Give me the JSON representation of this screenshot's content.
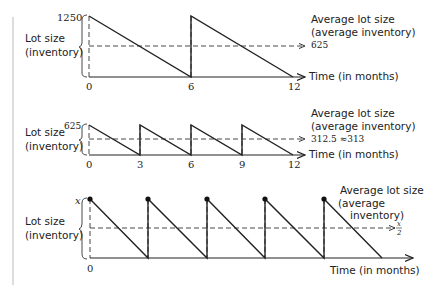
{
  "figure": {
    "margin_line_color": "#bbbbbb",
    "panels": [
      {
        "id": "annual-single-order",
        "y_label_line1": "Lot size",
        "y_label_line2": "(inventory)",
        "y_max_label": "1250",
        "x_ticks": [
          "0",
          "6",
          "12"
        ],
        "avg_label_line1": "Average lot size",
        "avg_label_line2": "(average inventory)",
        "avg_value": "625",
        "x_axis_label": "Time (in months)"
      },
      {
        "id": "quarterly-orders",
        "y_label_line1": "Lot size",
        "y_label_line2": "(inventory)",
        "y_max_label": "625",
        "x_ticks": [
          "0",
          "3",
          "6",
          "9",
          "12"
        ],
        "avg_label_line1": "Average lot size",
        "avg_label_line2": "(average inventory)",
        "avg_value": "312.5 ≈313",
        "x_axis_label": "Time (in months)"
      },
      {
        "id": "general-x-orders",
        "y_label_line1": "Lot size",
        "y_label_line2": "(inventory)",
        "y_max_label": "x",
        "x_ticks": [
          "0"
        ],
        "avg_label_line1": "Average lot size",
        "avg_label_line2": "(average",
        "avg_label_line3": "inventory)",
        "avg_value_numerator": "x",
        "avg_value_denominator": "2",
        "x_axis_label": "Time (in months)"
      }
    ]
  }
}
